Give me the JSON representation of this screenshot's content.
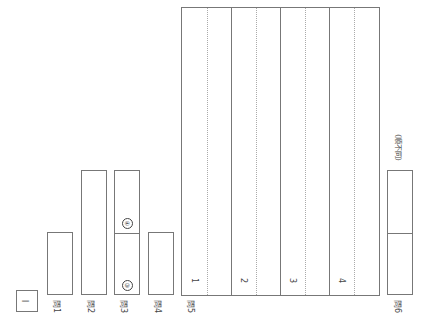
{
  "section": {
    "label": "I"
  },
  "questions": [
    {
      "label": "問1"
    },
    {
      "label": "問2"
    },
    {
      "label": "問3",
      "sub": [
        "③",
        "④"
      ]
    },
    {
      "label": "問4"
    },
    {
      "label": "問5",
      "items": [
        "1",
        "2",
        "3",
        "4"
      ]
    },
    {
      "label": "問6",
      "note": "（順不同）"
    }
  ]
}
